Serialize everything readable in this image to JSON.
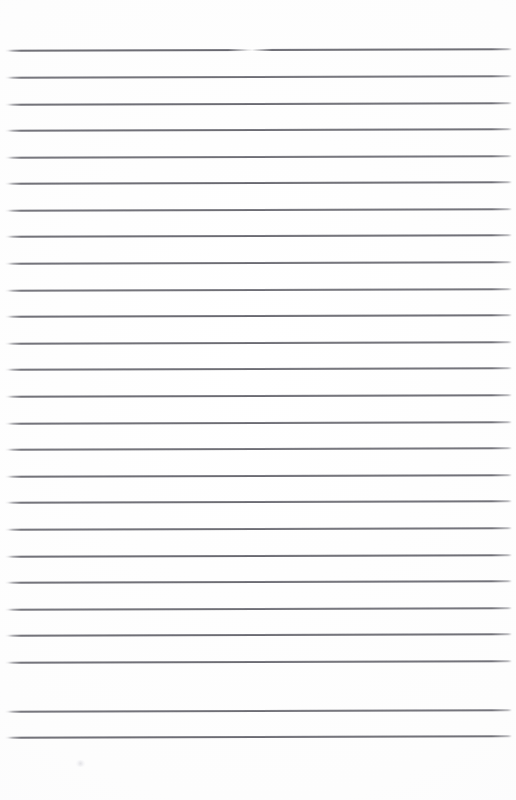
{
  "document": {
    "kind": "scanned-ruled-paper",
    "title": "Blank ruled notebook paper",
    "description": "A scanned blank sheet of lined/ruled writing paper with horizontal grey rules and no written content.",
    "page_width": 516,
    "page_height": 800,
    "background_color": "#fdfdfd",
    "rule_color": "#56565e",
    "rule_thickness_px": 1,
    "has_written_text": false,
    "has_margin_rule": false,
    "text_content": ""
  },
  "layout": {
    "top_margin_height": 50,
    "bottom_margin_height": 62,
    "left_inset": 4,
    "right_inset": 4,
    "rule_line_count": 26,
    "first_rule_y": 50,
    "last_rule_y": 737,
    "rule_spacing": 26.7,
    "page_skew_degrees": -0.16
  },
  "rules": [
    {
      "index": 1,
      "y": 50,
      "x_start": 5,
      "x_end": 512,
      "opacity": 0.95
    },
    {
      "index": 2,
      "y": 77,
      "x_start": 5,
      "x_end": 512,
      "opacity": 0.9
    },
    {
      "index": 3,
      "y": 104,
      "x_start": 5,
      "x_end": 512,
      "opacity": 0.93
    },
    {
      "index": 4,
      "y": 130,
      "x_start": 5,
      "x_end": 512,
      "opacity": 0.92
    },
    {
      "index": 5,
      "y": 157,
      "x_start": 5,
      "x_end": 512,
      "opacity": 0.9
    },
    {
      "index": 6,
      "y": 183,
      "x_start": 5,
      "x_end": 512,
      "opacity": 0.94
    },
    {
      "index": 7,
      "y": 210,
      "x_start": 5,
      "x_end": 512,
      "opacity": 0.91
    },
    {
      "index": 8,
      "y": 236,
      "x_start": 5,
      "x_end": 512,
      "opacity": 0.93
    },
    {
      "index": 9,
      "y": 263,
      "x_start": 5,
      "x_end": 512,
      "opacity": 0.92
    },
    {
      "index": 10,
      "y": 290,
      "x_start": 5,
      "x_end": 512,
      "opacity": 0.9
    },
    {
      "index": 11,
      "y": 316,
      "x_start": 5,
      "x_end": 512,
      "opacity": 0.94
    },
    {
      "index": 12,
      "y": 343,
      "x_start": 5,
      "x_end": 512,
      "opacity": 0.92
    },
    {
      "index": 13,
      "y": 369,
      "x_start": 5,
      "x_end": 512,
      "opacity": 0.91
    },
    {
      "index": 14,
      "y": 396,
      "x_start": 5,
      "x_end": 512,
      "opacity": 0.93
    },
    {
      "index": 15,
      "y": 423,
      "x_start": 5,
      "x_end": 512,
      "opacity": 0.92
    },
    {
      "index": 16,
      "y": 449,
      "x_start": 5,
      "x_end": 512,
      "opacity": 0.9
    },
    {
      "index": 17,
      "y": 476,
      "x_start": 5,
      "x_end": 512,
      "opacity": 0.93
    },
    {
      "index": 18,
      "y": 502,
      "x_start": 5,
      "x_end": 512,
      "opacity": 0.92
    },
    {
      "index": 19,
      "y": 529,
      "x_start": 5,
      "x_end": 512,
      "opacity": 0.91
    },
    {
      "index": 20,
      "y": 556,
      "x_start": 5,
      "x_end": 512,
      "opacity": 0.94
    },
    {
      "index": 21,
      "y": 582,
      "x_start": 5,
      "x_end": 512,
      "opacity": 0.92
    },
    {
      "index": 22,
      "y": 609,
      "x_start": 5,
      "x_end": 512,
      "opacity": 0.9
    },
    {
      "index": 23,
      "y": 635,
      "x_start": 5,
      "x_end": 512,
      "opacity": 0.93
    },
    {
      "index": 24,
      "y": 662,
      "x_start": 5,
      "x_end": 512,
      "opacity": 0.92
    },
    {
      "index": 25,
      "y": 711,
      "x_start": 5,
      "x_end": 512,
      "opacity": 0.91
    },
    {
      "index": 26,
      "y": 737,
      "x_start": 5,
      "x_end": 512,
      "opacity": 0.93
    }
  ],
  "artifacts": {
    "flare": {
      "on_rule_index": 1,
      "x": 228,
      "width": 44
    },
    "smudge": {
      "x": 76,
      "y": 760,
      "width": 9,
      "height": 7
    }
  }
}
